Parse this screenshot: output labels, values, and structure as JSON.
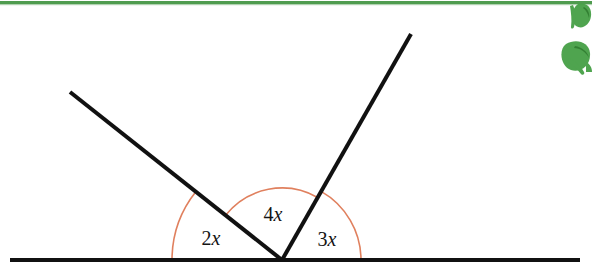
{
  "page": {
    "background_color": "#ffffff",
    "width": 592,
    "height": 276
  },
  "decorations": {
    "top_rule": {
      "name": "green-divider-line",
      "color": "#4f9c4f",
      "y": 2,
      "thickness": 3
    },
    "corner_graphic": {
      "name": "green-leaf-graphic",
      "color": "#46a046",
      "position": "top-right"
    }
  },
  "figure": {
    "type": "geometry-diagram",
    "line_color": "#111111",
    "arc_color": "#e0805e",
    "vertex": {
      "x": 282,
      "y": 260,
      "label": "vertex"
    },
    "baseline": {
      "name": "straight-line",
      "x1": 10,
      "y1": 260,
      "x2": 580,
      "y2": 260,
      "stroke_width": 4
    },
    "rays": [
      {
        "name": "left-ray",
        "x1": 282,
        "y1": 260,
        "x2": 70,
        "y2": 92,
        "stroke_width": 4,
        "angle_degrees": 141.6
      },
      {
        "name": "right-ray",
        "x1": 282,
        "y1": 260,
        "x2": 411,
        "y2": 34,
        "stroke_width": 4,
        "angle_degrees": 60.3
      }
    ],
    "arcs": [
      {
        "name": "outer-angle-arc",
        "radius": 110,
        "start_degrees": 180,
        "end_degrees": 141.6,
        "stroke_width": 1.6
      },
      {
        "name": "inner-angle-arc",
        "radius": 72,
        "start_degrees": 141.6,
        "end_degrees": 60.3,
        "stroke_width": 1.6
      },
      {
        "name": "right-angle-arc",
        "radius": 79,
        "start_degrees": 60.3,
        "end_degrees": 0,
        "stroke_width": 1.6
      }
    ],
    "labels": [
      {
        "name": "angle-label-2x",
        "coefficient": "2",
        "variable": "x",
        "text": "2x",
        "x": 211,
        "y": 240
      },
      {
        "name": "angle-label-4x",
        "coefficient": "4",
        "variable": "x",
        "text": "4x",
        "x": 273,
        "y": 216
      },
      {
        "name": "angle-label-3x",
        "coefficient": "3",
        "variable": "x",
        "text": "3x",
        "x": 327,
        "y": 241
      }
    ]
  }
}
